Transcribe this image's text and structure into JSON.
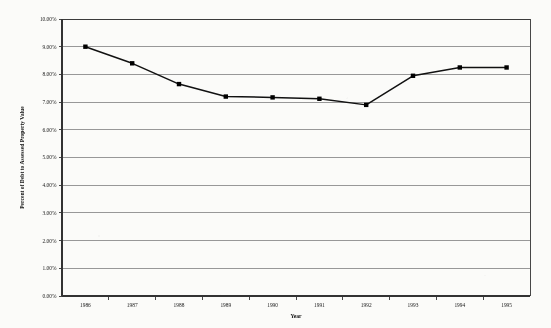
{
  "chart_data": {
    "type": "line",
    "title": "",
    "xlabel": "Year",
    "ylabel": "Percent of Debt to Assessed Property Value",
    "categories": [
      "1986",
      "1987",
      "1988",
      "1989",
      "1990",
      "1991",
      "1992",
      "1993",
      "1994",
      "1995"
    ],
    "values": [
      9.0,
      8.4,
      7.65,
      7.2,
      7.17,
      7.12,
      6.9,
      7.95,
      8.25,
      8.25
    ],
    "value_labels": [
      "9.00%",
      "8.40%",
      "7.65%",
      "7.20%",
      "7.17%",
      "7.12%",
      "6.90%",
      "7.95%",
      "8.25%",
      "8.25%"
    ],
    "ylim": [
      0,
      10
    ],
    "ytick_step": 1,
    "ytick_labels": [
      "0.00%",
      "1.00%",
      "2.00%",
      "3.00%",
      "4.00%",
      "5.00%",
      "6.00%",
      "7.00%",
      "8.00%",
      "9.00%",
      "10.00%"
    ],
    "ytick_values": [
      0,
      1,
      2,
      3,
      4,
      5,
      6,
      7,
      8,
      9,
      10
    ],
    "grid": true,
    "grid_axis": "y",
    "legend": false,
    "marker": "square",
    "series": [
      {
        "name": "Percent of Debt to Assessed Property Value",
        "values": [
          9.0,
          8.4,
          7.65,
          7.2,
          7.17,
          7.12,
          6.9,
          7.95,
          8.25,
          8.25
        ]
      }
    ],
    "colors": {
      "line": "#111111",
      "marker": "#000000",
      "grid": "#777777",
      "frame": "#333333",
      "background": "#fbfbf9"
    }
  }
}
